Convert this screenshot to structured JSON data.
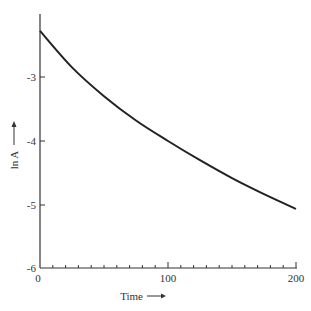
{
  "chart_data": {
    "type": "line",
    "title": "",
    "xlabel": "Time",
    "ylabel": "ln A",
    "xlim": [
      0,
      200
    ],
    "ylim": [
      -6,
      -2.1
    ],
    "x_ticks": [
      0,
      100,
      200
    ],
    "x_tick_labels": [
      "0",
      "100",
      "200"
    ],
    "x_minor_tick_step": 10,
    "y_ticks": [
      -3,
      -4,
      -5,
      -6
    ],
    "y_tick_labels": [
      "-3",
      "-4",
      "-5",
      "-6"
    ],
    "grid": false,
    "legend": null,
    "annotations": [
      "arrow pointing right after 'Time'",
      "arrow pointing up after 'ln A'"
    ],
    "series": [
      {
        "name": "ln A",
        "x": [
          0,
          25,
          50,
          75,
          100,
          125,
          150,
          175,
          200
        ],
        "values": [
          -2.28,
          -2.85,
          -3.3,
          -3.68,
          -4.0,
          -4.3,
          -4.58,
          -4.83,
          -5.06
        ]
      }
    ]
  },
  "labels": {
    "x_axis": "Time",
    "y_axis": "ln A",
    "x0": "0",
    "x100": "100",
    "x200": "200",
    "ym3": "-3",
    "ym4": "-4",
    "ym5": "-5",
    "ym6": "-6"
  }
}
